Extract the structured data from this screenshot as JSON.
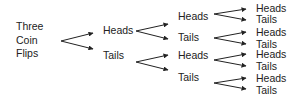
{
  "diagram": {
    "type": "probability-tree",
    "root": [
      "Three",
      "Coin",
      "Flips"
    ],
    "level1": [
      {
        "label": "Heads",
        "x": 103,
        "y": 24
      },
      {
        "label": "Tails",
        "x": 103,
        "y": 49
      }
    ],
    "level2": [
      {
        "label": "Heads",
        "x": 178,
        "y": 10
      },
      {
        "label": "Tails",
        "x": 178,
        "y": 31
      },
      {
        "label": "Heads",
        "x": 178,
        "y": 49
      },
      {
        "label": "Tails",
        "x": 178,
        "y": 71
      }
    ],
    "level3": [
      {
        "label": "Heads",
        "x": 256,
        "y": 2
      },
      {
        "label": "Tails",
        "x": 256,
        "y": 13
      },
      {
        "label": "Heads",
        "x": 256,
        "y": 26
      },
      {
        "label": "Tails",
        "x": 256,
        "y": 38
      },
      {
        "label": "Heads",
        "x": 256,
        "y": 48
      },
      {
        "label": "Tails",
        "x": 256,
        "y": 60
      },
      {
        "label": "Heads",
        "x": 256,
        "y": 72
      },
      {
        "label": "Tails",
        "x": 256,
        "y": 84
      }
    ],
    "arrow_color": "#222222"
  }
}
